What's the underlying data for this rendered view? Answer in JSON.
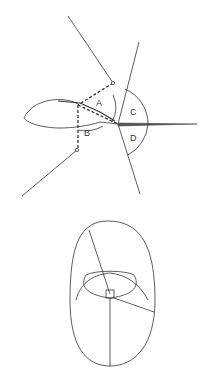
{
  "figure": {
    "top_panel": {
      "angle_labels": [
        "A",
        "B",
        "C",
        "D"
      ]
    },
    "bottom_panel": {}
  },
  "colors": {
    "line": "#333333",
    "background": "#ffffff"
  }
}
